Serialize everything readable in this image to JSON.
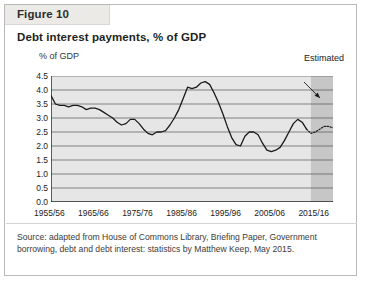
{
  "figure": {
    "tab_label": "Figure 10",
    "title": "Debt interest payments, % of GDP",
    "source_note": "Source: adapted from House of Commons Library, Briefing Paper, Government borrowing, debt and debt interest: statistics by Matthew Keep, May 2015."
  },
  "chart_data": {
    "type": "line",
    "title": "Debt interest payments, % of GDP",
    "xlabel": "",
    "ylabel": "% of GDP",
    "ylim": [
      0.0,
      4.5
    ],
    "yticks": [
      "0.0",
      "0.5",
      "1.0",
      "1.5",
      "2.0",
      "2.5",
      "3.0",
      "3.5",
      "4.0",
      "4.5"
    ],
    "ytick_values": [
      0.0,
      0.5,
      1.0,
      1.5,
      2.0,
      2.5,
      3.0,
      3.5,
      4.0,
      4.5
    ],
    "grid": true,
    "legend_position": "none",
    "xtick_labels": [
      "1955/56",
      "1965/66",
      "1975/76",
      "1985/86",
      "1995/96",
      "2005/06",
      "2015/16"
    ],
    "xtick_years": [
      1955,
      1965,
      1975,
      1985,
      1995,
      2005,
      2015
    ],
    "x_start": 1955,
    "x_end": 2019,
    "annotations": [
      {
        "text": "Estimated",
        "type": "arrow-label",
        "points_to_year": 2015
      }
    ],
    "estimated_region": {
      "start_year": 2014,
      "end_year": 2019,
      "shade_color": "#c6c6c6"
    },
    "series": [
      {
        "name": "Debt interest payments, % of GDP",
        "style": "solid",
        "color": "#1a1a1a",
        "x": [
          1955,
          1956,
          1957,
          1958,
          1959,
          1960,
          1961,
          1962,
          1963,
          1964,
          1965,
          1966,
          1967,
          1968,
          1969,
          1970,
          1971,
          1972,
          1973,
          1974,
          1975,
          1976,
          1977,
          1978,
          1979,
          1980,
          1981,
          1982,
          1983,
          1984,
          1985,
          1986,
          1987,
          1988,
          1989,
          1990,
          1991,
          1992,
          1993,
          1994,
          1995,
          1996,
          1997,
          1998,
          1999,
          2000,
          2001,
          2002,
          2003,
          2004,
          2005,
          2006,
          2007,
          2008,
          2009,
          2010,
          2011,
          2012,
          2013
        ],
        "values": [
          3.8,
          3.5,
          3.45,
          3.45,
          3.4,
          3.45,
          3.45,
          3.4,
          3.3,
          3.35,
          3.35,
          3.3,
          3.2,
          3.1,
          3.0,
          2.85,
          2.75,
          2.8,
          2.95,
          2.95,
          2.8,
          2.6,
          2.45,
          2.4,
          2.5,
          2.5,
          2.55,
          2.75,
          3.0,
          3.3,
          3.7,
          4.1,
          4.05,
          4.1,
          4.25,
          4.3,
          4.2,
          3.9,
          3.55,
          3.15,
          2.7,
          2.3,
          2.05,
          2.0,
          2.35,
          2.5,
          2.5,
          2.4,
          2.1,
          1.85,
          1.8,
          1.85,
          1.95,
          2.2,
          2.5,
          2.8,
          2.95,
          2.85,
          2.6
        ]
      },
      {
        "name": "Debt interest payments, % of GDP (estimated)",
        "style": "dotted",
        "color": "#1a1a1a",
        "x": [
          2013,
          2014,
          2015,
          2016,
          2017,
          2018,
          2019
        ],
        "values": [
          2.6,
          2.45,
          2.5,
          2.6,
          2.7,
          2.7,
          2.65
        ]
      }
    ]
  }
}
